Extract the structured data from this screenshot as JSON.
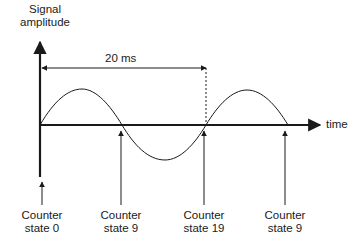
{
  "diagram": {
    "y_axis_label_line1": "Signal",
    "y_axis_label_line2": "amplitude",
    "x_axis_label": "time",
    "period_label": "20 ms",
    "markers": [
      {
        "line1": "Counter",
        "line2": "state 0"
      },
      {
        "line1": "Counter",
        "line2": "state 9"
      },
      {
        "line1": "Counter",
        "line2": "state 19"
      },
      {
        "line1": "Counter",
        "line2": "state 9"
      }
    ],
    "colors": {
      "line": "#1a1a1a",
      "background": "#ffffff"
    }
  }
}
